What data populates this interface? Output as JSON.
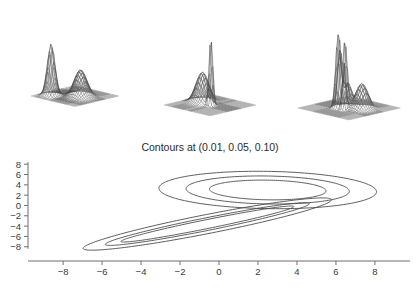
{
  "figure": {
    "background_color": "#ffffff",
    "line_color": "#4c4c4c",
    "axis_color": "#6e6e6e",
    "mesh_color": "#8d8d8d"
  },
  "surface_panels": [
    {
      "name": "surface-plot-left",
      "description": "perspective wireframe mesh density surface with two peaks, tall narrow spike at left and broader rounded peak at right"
    },
    {
      "name": "surface-plot-middle",
      "description": "perspective wireframe mesh density surface with one very tall narrow spike and one smaller smooth bump"
    },
    {
      "name": "surface-plot-right",
      "description": "perspective wireframe mesh density surface with several jagged tall spikes and one rounded peak"
    }
  ],
  "chart_data": {
    "type": "line",
    "title": "Contours at (0.01, 0.05, 0.10)",
    "xlabel": "",
    "ylabel": "",
    "xlim": [
      -9.8,
      9.8
    ],
    "ylim": [
      -9.6,
      9.2
    ],
    "xticks": [
      -8,
      -6,
      -4,
      -2,
      0,
      2,
      4,
      6,
      8
    ],
    "xticklabels": [
      "-8",
      "-6",
      "-4",
      "-2",
      "0",
      "2",
      "4",
      "6",
      "8"
    ],
    "yticks": [
      8,
      6,
      4,
      2,
      0,
      -2,
      -4,
      -6,
      -8
    ],
    "yticklabels": [
      "8",
      "6",
      "4",
      "2",
      "0",
      "-2",
      "-4",
      "-6",
      "-8"
    ],
    "grid": false,
    "legend": null,
    "contour_levels": [
      0.01,
      0.05,
      0.1
    ],
    "components": [
      {
        "name": "upper-right-component",
        "shape": "nested ellipses, slightly tilted, centred near (2.5, 3.0)",
        "center": [
          2.5,
          3.0
        ],
        "levels": [
          {
            "level": 0.01,
            "rx": 5.6,
            "ry": 3.6,
            "rotation_deg": -6
          },
          {
            "level": 0.05,
            "rx": 4.2,
            "ry": 2.7,
            "rotation_deg": -6
          },
          {
            "level": 0.1,
            "rx": 3.0,
            "ry": 1.9,
            "rotation_deg": -6
          }
        ]
      },
      {
        "name": "lower-left-component",
        "shape": "highly elongated nested ellipses tilted about -38 degrees, centred near (-0.6, -3.6)",
        "center": [
          -0.6,
          -3.6
        ],
        "levels": [
          {
            "level": 0.01,
            "rx": 8.0,
            "ry": 1.5,
            "rotation_deg": 38
          },
          {
            "level": 0.05,
            "rx": 6.6,
            "ry": 1.0,
            "rotation_deg": 38
          },
          {
            "level": 0.1,
            "rx": 5.6,
            "ry": 0.7,
            "rotation_deg": 38
          }
        ]
      }
    ]
  }
}
